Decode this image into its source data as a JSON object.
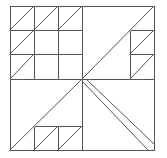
{
  "diagram": {
    "title": "",
    "type": "quilt-block-line-drawing",
    "stroke_color": "#555555",
    "background": "#ffffff",
    "frame": {
      "x1": 10,
      "y1": 6,
      "x2": 154,
      "y2": 150
    },
    "lines": [
      {
        "id": "mid-vertical",
        "x1": 82,
        "y1": 6,
        "x2": 82,
        "y2": 150
      },
      {
        "id": "mid-horizontal",
        "x1": 10,
        "y1": 79,
        "x2": 154,
        "y2": 79
      },
      {
        "id": "tl-h1",
        "x1": 10,
        "y1": 30,
        "x2": 82,
        "y2": 30
      },
      {
        "id": "tl-h2",
        "x1": 10,
        "y1": 54,
        "x2": 82,
        "y2": 54
      },
      {
        "id": "tl-v1",
        "x1": 34,
        "y1": 6,
        "x2": 34,
        "y2": 79
      },
      {
        "id": "tl-v2",
        "x1": 58,
        "y1": 6,
        "x2": 58,
        "y2": 79
      },
      {
        "id": "tl-d-r1c1",
        "x1": 10,
        "y1": 30,
        "x2": 34,
        "y2": 6,
        "diag": true
      },
      {
        "id": "tl-d-r1c2",
        "x1": 34,
        "y1": 30,
        "x2": 58,
        "y2": 6,
        "diag": true
      },
      {
        "id": "tl-d-r1c3",
        "x1": 58,
        "y1": 30,
        "x2": 82,
        "y2": 6,
        "diag": true
      },
      {
        "id": "tl-d-r2c1",
        "x1": 10,
        "y1": 54,
        "x2": 34,
        "y2": 30,
        "diag": true
      },
      {
        "id": "tl-d-r3c1",
        "x1": 10,
        "y1": 79,
        "x2": 34,
        "y2": 54,
        "diag": true
      },
      {
        "id": "tr-big-diag",
        "x1": 82,
        "y1": 79,
        "x2": 154,
        "y2": 6,
        "diag": true
      },
      {
        "id": "tr-v",
        "x1": 130,
        "y1": 30,
        "x2": 130,
        "y2": 79
      },
      {
        "id": "tr-h1",
        "x1": 130,
        "y1": 30,
        "x2": 154,
        "y2": 30
      },
      {
        "id": "tr-h2",
        "x1": 130,
        "y1": 54,
        "x2": 154,
        "y2": 54
      },
      {
        "id": "tr-d1",
        "x1": 130,
        "y1": 54,
        "x2": 154,
        "y2": 30,
        "diag": true
      },
      {
        "id": "tr-d2",
        "x1": 130,
        "y1": 79,
        "x2": 154,
        "y2": 54,
        "diag": true
      },
      {
        "id": "bl-big-diag",
        "x1": 10,
        "y1": 150,
        "x2": 82,
        "y2": 79,
        "diag": true
      },
      {
        "id": "bl-h",
        "x1": 34,
        "y1": 126,
        "x2": 82,
        "y2": 126
      },
      {
        "id": "bl-v1",
        "x1": 34,
        "y1": 126,
        "x2": 34,
        "y2": 150
      },
      {
        "id": "bl-v2",
        "x1": 58,
        "y1": 126,
        "x2": 58,
        "y2": 150
      },
      {
        "id": "bl-d1",
        "x1": 34,
        "y1": 150,
        "x2": 58,
        "y2": 126,
        "diag": true
      },
      {
        "id": "bl-d2",
        "x1": 58,
        "y1": 150,
        "x2": 82,
        "y2": 126,
        "diag": true
      },
      {
        "id": "br-band-1",
        "x1": 82,
        "y1": 81,
        "x2": 148,
        "y2": 150,
        "diag": true
      },
      {
        "id": "br-band-2",
        "x1": 86,
        "y1": 79,
        "x2": 154,
        "y2": 144,
        "diag": true
      }
    ]
  }
}
